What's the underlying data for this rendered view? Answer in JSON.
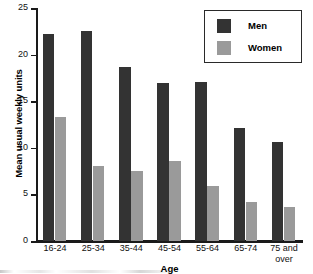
{
  "chart_data": {
    "type": "bar",
    "title": "",
    "xlabel": "Age",
    "ylabel": "Mean usual weekly units",
    "categories": [
      "16-24",
      "25-34",
      "35-44",
      "45-54",
      "55-64",
      "65-74",
      "75 and over"
    ],
    "category_lines": [
      [
        "16-24"
      ],
      [
        "25-34"
      ],
      [
        "35-44"
      ],
      [
        "45-54"
      ],
      [
        "55-64"
      ],
      [
        "65-74"
      ],
      [
        "75 and",
        "over"
      ]
    ],
    "series": [
      {
        "name": "Men",
        "color": "#333333",
        "values": [
          22.2,
          22.5,
          18.7,
          17.0,
          17.1,
          12.1,
          10.6
        ]
      },
      {
        "name": "Women",
        "color": "#9a9a9a",
        "values": [
          13.3,
          8.0,
          7.5,
          8.6,
          5.9,
          4.2,
          3.6
        ]
      }
    ],
    "ylim": [
      0,
      25
    ],
    "yticks": [
      0,
      5,
      10,
      15,
      20,
      25
    ],
    "ytick_labels": [
      "0",
      "5",
      "10",
      "15",
      "20",
      "25"
    ],
    "grid": false,
    "legend_position": "top-right"
  },
  "legend": {
    "items": [
      {
        "label": "Men"
      },
      {
        "label": "Women"
      }
    ]
  }
}
